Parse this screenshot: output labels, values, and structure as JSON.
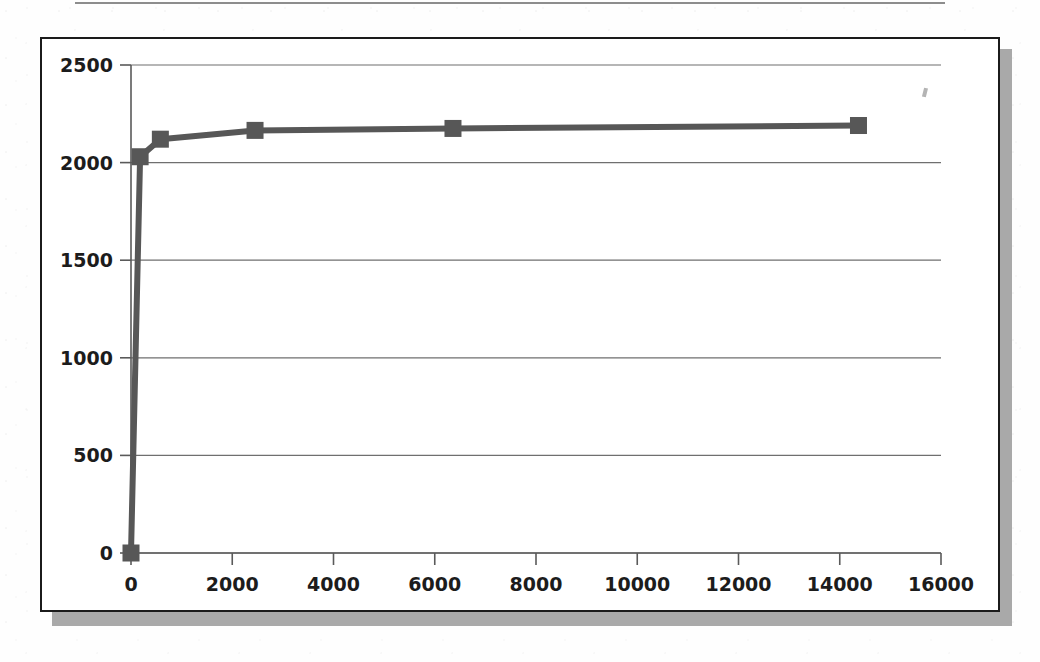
{
  "document": {
    "top_rule": "horizontal-rule"
  },
  "chart_panel": {
    "title": "",
    "frame_border_color": "#1b1b1b",
    "background_color": "#ffffff",
    "shadow_color": "#a9a9a9"
  },
  "chart_data": {
    "type": "line",
    "title": "",
    "subtitle": "",
    "xlabel": "",
    "ylabel": "",
    "xlim": [
      0,
      16000
    ],
    "ylim": [
      0,
      2500
    ],
    "xticks": [
      0,
      2000,
      4000,
      6000,
      8000,
      10000,
      12000,
      14000,
      16000
    ],
    "yticks": [
      0,
      500,
      1000,
      1500,
      2000,
      2500
    ],
    "xtick_labels": [
      "0",
      "2000",
      "4000",
      "6000",
      "8000",
      "10000",
      "12000",
      "14000",
      "16000"
    ],
    "ytick_labels": [
      "0",
      "500",
      "1000",
      "1500",
      "2000",
      "2500"
    ],
    "grid": "horizontal",
    "legend": "none",
    "marker": "square",
    "series_color": "#575757",
    "series": [
      {
        "name": "series-1",
        "x": [
          0,
          180,
          580,
          2450,
          6360,
          14370
        ],
        "y": [
          0,
          2030,
          2120,
          2165,
          2175,
          2190
        ]
      }
    ]
  }
}
